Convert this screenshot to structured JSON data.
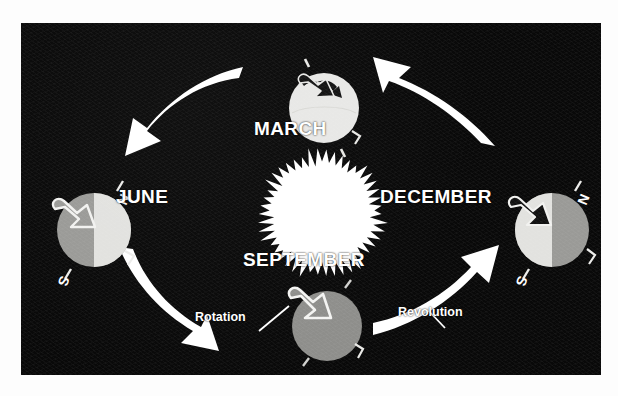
{
  "diagram": {
    "background_color": "#090909",
    "accent_color": "#ffffff",
    "panel": {
      "x": 21,
      "y": 23,
      "width": 580,
      "height": 352
    }
  },
  "sun": {
    "name": "Sun",
    "color": "#ffffff",
    "center": {
      "x": 301,
      "y": 191
    },
    "radius": 60,
    "spikes": 46
  },
  "positions": [
    {
      "id": "march",
      "label": "MARCH",
      "center": {
        "x": 303,
        "y": 88
      },
      "radius": 35,
      "lit_side": "full",
      "lit_color": "#e8e8e6",
      "dark_color": "#e8e8e6",
      "arrow_style": "filled-dark",
      "axis_labels": {
        "north": "",
        "south": ""
      },
      "axis_tilt_deg": -23.5
    },
    {
      "id": "june",
      "label": "JUNE",
      "center": {
        "x": 78,
        "y": 207
      },
      "radius": 37,
      "lit_side": "right",
      "lit_color": "#e2e2df",
      "dark_color": "#9a9a97",
      "arrow_style": "outline-light",
      "axis_labels": {
        "north": "N",
        "south": "S"
      },
      "axis_tilt_deg": -23.5
    },
    {
      "id": "september",
      "label": "SEPTEMBER",
      "center": {
        "x": 306,
        "y": 303
      },
      "radius": 35,
      "lit_side": "none",
      "lit_color": "#8e8e8b",
      "dark_color": "#8e8e8b",
      "arrow_style": "outline-light",
      "axis_labels": {
        "north": "",
        "south": ""
      },
      "axis_tilt_deg": -23.5
    },
    {
      "id": "december",
      "label": "DECEMBER",
      "center": {
        "x": 536,
        "y": 207
      },
      "radius": 37,
      "lit_side": "left",
      "lit_color": "#e2e2df",
      "dark_color": "#9a9a97",
      "arrow_style": "filled-dark",
      "axis_labels": {
        "north": "N",
        "south": "S"
      },
      "axis_tilt_deg": -23.5
    }
  ],
  "orbit_arrows": [
    {
      "id": "march-to-june",
      "from": "march",
      "to": "june",
      "direction": "down-left",
      "color": "#ffffff"
    },
    {
      "id": "june-to-september",
      "from": "june",
      "to": "september",
      "direction": "down-right",
      "color": "#ffffff"
    },
    {
      "id": "september-to-december",
      "from": "september",
      "to": "december",
      "direction": "up-right",
      "color": "#ffffff"
    },
    {
      "id": "december-to-march",
      "from": "december",
      "to": "march",
      "direction": "up-left",
      "color": "#ffffff"
    }
  ],
  "callouts": [
    {
      "id": "rotation",
      "label": "Rotation",
      "points_to": "september-spin-arrow",
      "color": "#ffffff"
    },
    {
      "id": "revolution",
      "label": "Revolution",
      "points_to": "september-to-december",
      "color": "#ffffff"
    }
  ]
}
